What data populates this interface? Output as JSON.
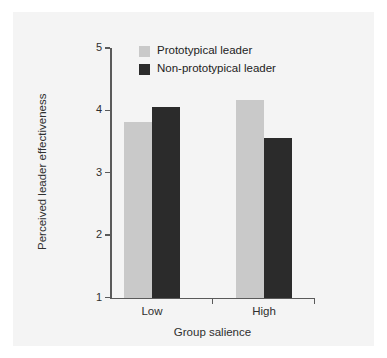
{
  "chart_data": {
    "type": "bar",
    "title": "",
    "xlabel": "Group salience",
    "ylabel": "Perceived leader effectiveness",
    "categories": [
      "Low",
      "High"
    ],
    "ylim": [
      1,
      5
    ],
    "yticks": [
      1,
      2,
      3,
      4,
      5
    ],
    "ytick_labels": [
      "1",
      "2",
      "3",
      "4",
      "5"
    ],
    "grid": false,
    "legend_position": "top-center",
    "series": [
      {
        "name": "Prototypical leader",
        "color": "#c9c9c9",
        "values": [
          3.82,
          4.16
        ]
      },
      {
        "name": "Non-prototypical leader",
        "color": "#2b2b2b",
        "values": [
          4.05,
          3.55
        ]
      }
    ]
  },
  "figure": {
    "background": "#f4f4f4",
    "axis_color": "#5a5a5a",
    "text_color": "#2f2f2f"
  }
}
